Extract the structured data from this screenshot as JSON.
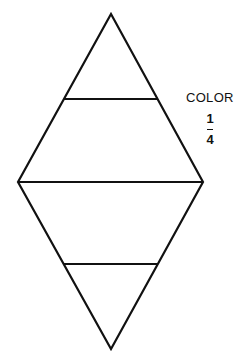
{
  "diagram": {
    "label": "COLOR",
    "fraction": {
      "numerator": "1",
      "denominator": "4"
    },
    "shape": "rhombus divided by three horizontal lines into four regions",
    "stroke_color": "#111111",
    "vertices": {
      "top": [
        111,
        14
      ],
      "left": [
        18,
        182
      ],
      "right": [
        203,
        182
      ],
      "bottom": [
        111,
        349
      ]
    },
    "lines": [
      {
        "y": 99,
        "x1": 64,
        "x2": 158
      },
      {
        "y": 182,
        "x1": 18,
        "x2": 203
      },
      {
        "y": 264,
        "x1": 64,
        "x2": 158
      }
    ]
  }
}
